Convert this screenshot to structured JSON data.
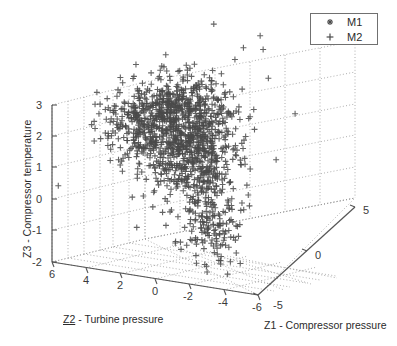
{
  "chart_data": {
    "type": "scatter",
    "projection": "3d",
    "title": "",
    "xlabel": "Z1 - Compressor pressure",
    "ylabel": "Z2 - Turbine pressure",
    "zlabel": "Z3 - Compressor temperature",
    "axes": {
      "z1": {
        "label": "Z1 - Compressor pressure",
        "ticks": [
          -5,
          0,
          5
        ],
        "tick_labels": [
          "-5",
          "0",
          "5"
        ],
        "range": [
          -5,
          5
        ]
      },
      "z2": {
        "label": "Z2 - Turbine pressure",
        "label_prefix": "Z2",
        "label_suffix": " - Turbine pressure",
        "ticks": [
          6,
          4,
          2,
          0,
          -2,
          -4,
          -6
        ],
        "tick_labels": [
          "6",
          "4",
          "2",
          "0",
          "-2",
          "-4",
          "-6"
        ],
        "range": [
          6,
          -6
        ]
      },
      "z3": {
        "label": "Z3 - Compressor temperature",
        "ticks": [
          3,
          2,
          1,
          0,
          -1,
          -2
        ],
        "tick_labels": [
          "3",
          "2",
          "1",
          "0",
          "-1",
          "-2"
        ],
        "range": [
          -2,
          3
        ]
      }
    },
    "grid": true,
    "grid_style": "dotted",
    "legend": {
      "position": "top-right",
      "entries": [
        {
          "name": "M1",
          "marker": "asterisk-marker",
          "color": "#4a4a4a"
        },
        {
          "name": "M2",
          "marker": "plus-marker",
          "color": "#4a4a4a"
        }
      ]
    },
    "series": [
      {
        "name": "M2",
        "marker": "plus",
        "color": "#4a4a4a",
        "n_points": 1400,
        "description": "Dense single cluster of plus markers forming an inverted-L / boomerang shape: a horizontal arm extending to the left at mid-height and a vertical arm descending toward the front-bottom right.",
        "cluster_centroid": [
          -1.0,
          0.5,
          1.2
        ],
        "z1_spread": [
          -4.5,
          3.0
        ],
        "z2_spread": [
          -4.0,
          5.0
        ],
        "z3_spread": [
          -2.0,
          3.0
        ]
      }
    ]
  },
  "colors": {
    "marker": "#4a4a4a",
    "axis": "#555555",
    "grid": "#9a9a9a",
    "text": "#2b2b2b",
    "background": "#ffffff",
    "legend_border": "#707070"
  },
  "legend": {
    "entries": [
      {
        "label": "M1"
      },
      {
        "label": "M2"
      }
    ]
  },
  "axis_titles": {
    "z1": "Z1 - Compressor pressure",
    "z2_prefix": "Z2",
    "z2_rest": " - Turbine pressure",
    "z3": "Z3 - Compressor temperature"
  },
  "ticks": {
    "z3": [
      "3",
      "2",
      "1",
      "0",
      "-1",
      "-2"
    ],
    "z2": [
      "6",
      "4",
      "2",
      "0",
      "-2",
      "-4",
      "-6"
    ],
    "z1": [
      "-5",
      "0",
      "5"
    ]
  }
}
